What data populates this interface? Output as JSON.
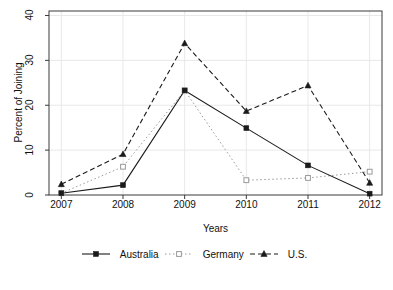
{
  "chart_data": {
    "type": "line",
    "title": "",
    "xlabel": "Years",
    "ylabel": "Percent of Joining",
    "categories": [
      "2007",
      "2008",
      "2009",
      "2010",
      "2011",
      "2012"
    ],
    "x": [
      2007,
      2008,
      2009,
      2010,
      2011,
      2012
    ],
    "xlim": [
      2006.8,
      2012.2
    ],
    "ylim": [
      0,
      41
    ],
    "ytick_labels": [
      "0",
      "10",
      "20",
      "30",
      "40"
    ],
    "yticks": [
      0,
      10,
      20,
      30,
      40
    ],
    "grid": true,
    "legend_position": "bottom",
    "series": [
      {
        "name": "Australia",
        "values": [
          0.4,
          2.2,
          23.3,
          14.9,
          6.6,
          0.3
        ],
        "line_style": "solid",
        "marker": "filled-square",
        "color": "#1a1a1a"
      },
      {
        "name": "Germany",
        "values": [
          0.4,
          6.3,
          23.3,
          3.3,
          3.8,
          5.2
        ],
        "line_style": "dotted",
        "marker": "open-square",
        "color": "#9a9a9a"
      },
      {
        "name": "U.S.",
        "values": [
          2.4,
          9.1,
          33.8,
          18.7,
          24.4,
          2.7
        ],
        "line_style": "dashed",
        "marker": "filled-triangle",
        "color": "#1a1a1a"
      }
    ]
  },
  "legend": {
    "entries": [
      {
        "label": "Australia"
      },
      {
        "label": "Germany"
      },
      {
        "label": "U.S."
      }
    ]
  },
  "colors": {
    "axis": "#3a3a3a",
    "grid": "#e8e8e8",
    "series_dark": "#1a1a1a",
    "series_light": "#9a9a9a",
    "background": "#ffffff"
  }
}
